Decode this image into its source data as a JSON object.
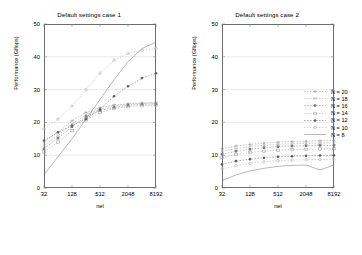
{
  "figure": {
    "width": 362,
    "height": 255,
    "background": "#ffffff"
  },
  "panels": [
    {
      "id": "case-1",
      "title": "Default settings case 1",
      "xlabel": "nel",
      "ylabel": "Performance (Gflops)"
    },
    {
      "id": "case-2",
      "title": "Default settings case 2",
      "xlabel": "nel",
      "ylabel": "Performance (Gflops)"
    }
  ],
  "axis": {
    "yticks": [
      "0",
      "10",
      "20",
      "30",
      "40",
      "50"
    ],
    "xticks": [
      "32",
      "128",
      "512",
      "2048",
      "8192"
    ]
  },
  "legend": {
    "entries": [
      {
        "label": "N = 20",
        "color": "#8c8c8c",
        "marker": "plus"
      },
      {
        "label": "N = 18",
        "color": "#9a9a9a",
        "marker": "cross"
      },
      {
        "label": "N = 16",
        "color": "#7a7a7a",
        "marker": "square"
      },
      {
        "label": "N = 14",
        "color": "#a0a0a0",
        "marker": "square-open"
      },
      {
        "label": "N = 12",
        "color": "#5f5f5f",
        "marker": "circle"
      },
      {
        "label": "N = 10",
        "color": "#b0b0b0",
        "marker": "circle-open"
      },
      {
        "label": "N = 8",
        "color": "#707070",
        "marker": "line"
      }
    ]
  },
  "chart_data": [
    {
      "type": "line",
      "id": "case-1",
      "title": "Default settings case 1",
      "xlabel": "nel",
      "ylabel": "Performance (Gflops)",
      "xscale": "log2",
      "x": [
        32,
        64,
        128,
        256,
        512,
        1024,
        2048,
        4096,
        8192
      ],
      "xticks": [
        32,
        128,
        512,
        2048,
        8192
      ],
      "ylim": [
        0,
        50
      ],
      "yticks": [
        0,
        10,
        20,
        30,
        40,
        50
      ],
      "grid": true,
      "legend_position": "outside-right",
      "series": [
        {
          "name": "N = 20",
          "color": "#8c8c8c",
          "marker": "plus",
          "values": [
            14.0,
            17.0,
            20.5,
            23.0,
            24.5,
            25.3,
            25.7,
            25.9,
            26.0
          ]
        },
        {
          "name": "N = 18",
          "color": "#9a9a9a",
          "marker": "cross",
          "values": [
            13.0,
            16.0,
            19.5,
            22.3,
            24.0,
            25.0,
            25.5,
            25.8,
            25.9
          ]
        },
        {
          "name": "N = 16",
          "color": "#7a7a7a",
          "marker": "square",
          "values": [
            12.0,
            15.2,
            18.7,
            21.8,
            23.6,
            24.6,
            25.2,
            25.5,
            25.6
          ]
        },
        {
          "name": "N = 14",
          "color": "#a0a0a0",
          "marker": "square-open",
          "values": [
            11.0,
            14.0,
            17.5,
            20.8,
            23.0,
            24.2,
            24.8,
            25.1,
            25.2
          ]
        },
        {
          "name": "N = 12",
          "color": "#5f5f5f",
          "marker": "circle",
          "values": [
            14.5,
            17.0,
            19.0,
            21.0,
            24.0,
            28.0,
            31.0,
            33.5,
            35.0
          ]
        },
        {
          "name": "N = 10",
          "color": "#b0b0b0",
          "marker": "circle-open",
          "values": [
            18.0,
            21.0,
            25.0,
            30.0,
            35.0,
            39.0,
            41.0,
            42.0,
            42.5
          ]
        },
        {
          "name": "N = 8",
          "color": "#707070",
          "marker": "line",
          "values": [
            4.0,
            9.5,
            15.0,
            21.0,
            27.0,
            33.0,
            38.5,
            42.5,
            44.5
          ]
        }
      ]
    },
    {
      "type": "line",
      "id": "case-2",
      "title": "Default settings case 2",
      "xlabel": "nel",
      "ylabel": "Performance (Gflops)",
      "xscale": "log2",
      "x": [
        32,
        64,
        128,
        256,
        512,
        1024,
        2048,
        4096,
        8192
      ],
      "xticks": [
        32,
        128,
        512,
        2048,
        8192
      ],
      "ylim": [
        0,
        50
      ],
      "yticks": [
        0,
        10,
        20,
        30,
        40,
        50
      ],
      "grid": true,
      "legend_position": "outside-right",
      "series": [
        {
          "name": "N = 20",
          "color": "#8c8c8c",
          "marker": "plus",
          "values": [
            12.0,
            12.8,
            13.3,
            13.7,
            14.0,
            14.2,
            14.3,
            14.4,
            14.5
          ]
        },
        {
          "name": "N = 18",
          "color": "#9a9a9a",
          "marker": "cross",
          "values": [
            11.2,
            12.0,
            12.6,
            13.0,
            13.3,
            13.5,
            13.6,
            13.7,
            13.8
          ]
        },
        {
          "name": "N = 16",
          "color": "#7a7a7a",
          "marker": "square",
          "values": [
            10.3,
            11.2,
            11.8,
            12.3,
            12.6,
            12.8,
            12.9,
            13.0,
            13.0
          ]
        },
        {
          "name": "N = 14",
          "color": "#a0a0a0",
          "marker": "square-open",
          "values": [
            9.3,
            10.2,
            10.8,
            11.2,
            11.5,
            11.7,
            11.8,
            11.9,
            12.0
          ]
        },
        {
          "name": "N = 12",
          "color": "#5f5f5f",
          "marker": "circle",
          "values": [
            7.2,
            8.2,
            8.8,
            9.2,
            9.5,
            9.7,
            9.8,
            9.9,
            10.0
          ]
        },
        {
          "name": "N = 10",
          "color": "#b0b0b0",
          "marker": "circle-open",
          "values": [
            5.8,
            6.8,
            7.5,
            8.0,
            8.3,
            8.5,
            8.6,
            8.7,
            8.8
          ]
        },
        {
          "name": "N = 8",
          "color": "#707070",
          "marker": "line",
          "values": [
            2.2,
            4.0,
            5.2,
            6.0,
            6.6,
            6.9,
            7.0,
            5.5,
            7.0
          ]
        }
      ]
    }
  ]
}
